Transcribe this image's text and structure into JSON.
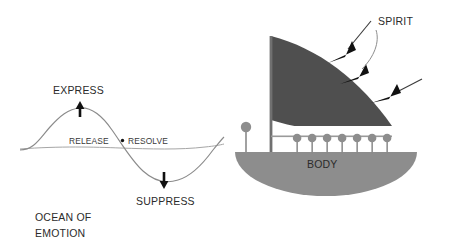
{
  "figure": {
    "title_present": false,
    "background_color": "#ffffff",
    "width": 455,
    "height": 249
  },
  "colors": {
    "sail_gray": "#4f4f4f",
    "hull_gray": "#8d8d8d",
    "pin_gray": "#8d8d8d",
    "wave_stroke": "#8b8b8b",
    "arrow_black": "#111111",
    "text_dark": "#2b2b2b",
    "text_mid": "#3a3a3a"
  },
  "ocean": {
    "labels": {
      "express": "EXPRESS",
      "suppress": "SUPPRESS",
      "release": "RELEASE",
      "separator": "•",
      "resolve": "RESOLVE",
      "caption_line1": "OCEAN OF",
      "caption_line2": "EMOTION"
    },
    "icons": {
      "express_arrow": "arrow-up-icon",
      "suppress_arrow": "arrow-down-icon"
    }
  },
  "boat": {
    "labels": {
      "spirit": "SPIRIT",
      "body": "BODY"
    },
    "icons": {
      "sail": "sail-icon",
      "hull": "hull-icon",
      "mast": "mast-icon",
      "bow_pin": "bow-pin-icon",
      "deck_pin": "deck-pin-icon",
      "wind_arrow": "arrow-left-down-icon",
      "spirit_leader": "leader-line-icon"
    },
    "deck_pin_count": 7,
    "wind_arrow_count": 3
  }
}
